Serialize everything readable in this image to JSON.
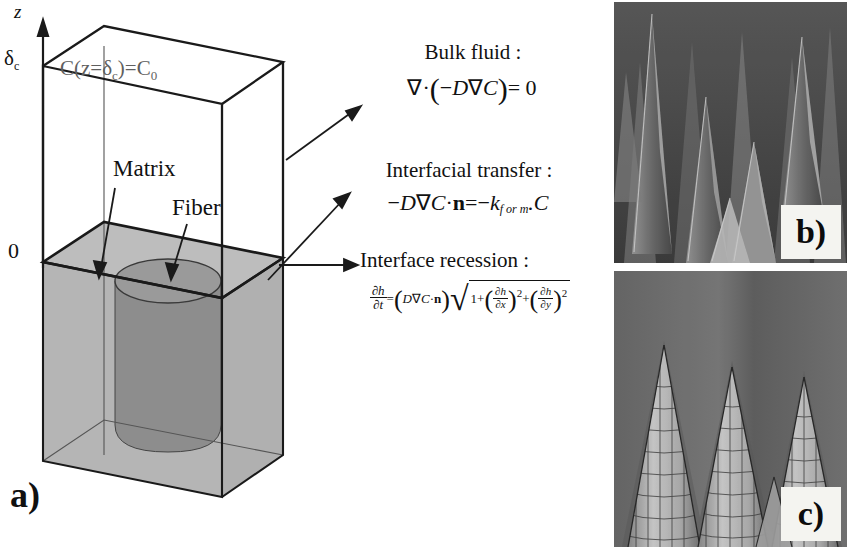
{
  "figure": {
    "panels": [
      {
        "id": "a",
        "tag": "a)",
        "caption_tag": "a)"
      },
      {
        "id": "b",
        "tag": "b)",
        "caption_tag": "b)"
      },
      {
        "id": "c",
        "tag": "c)",
        "caption_tag": "c)"
      }
    ]
  },
  "schematic": {
    "axis_label": "z",
    "axis_top_tick": "δ",
    "axis_top_tick_sub": "c",
    "axis_zero_tick": "0",
    "top_boundary_condition": "C(z=δ",
    "top_boundary_condition_sub": "c",
    "top_boundary_condition_end": ")=C",
    "top_boundary_condition_sub2": "0",
    "region_label_matrix": "Matrix",
    "region_label_fiber": "Fiber",
    "panel_tag": "a)",
    "colors": {
      "composite_block": "#b5b5b5",
      "fiber_cylinder": "#8d8d8d",
      "outline": "#1a1a1a",
      "top_text": "#5f5f5f"
    }
  },
  "equations": {
    "bulk": {
      "heading": "Bulk fluid :",
      "nabla": "∇",
      "dot": "·",
      "open": "(",
      "minus": "−",
      "D": "D",
      "C": "C",
      "close": ")",
      "equals": "= 0",
      "plain": "∇·(−D∇C) = 0"
    },
    "interfacial": {
      "heading": "Interfacial transfer :",
      "minus": "−",
      "D": "D",
      "nabla": "∇",
      "C": "C",
      "dot": "·",
      "n": "n",
      "equals": "=",
      "minus2": "−",
      "k": "k",
      "k_sub": "f or m",
      "dotC": ".C",
      "plain": "−D∇C·n = −k_(f or m).C"
    },
    "recession": {
      "heading": "Interface recession :",
      "lhs_num": "∂h",
      "lhs_den": "∂t",
      "equals": "=",
      "open": "(",
      "D": "D",
      "nabla": "∇",
      "C": "C",
      "dot": "·",
      "n": "n",
      "close": ")",
      "radical": "√",
      "one_plus": "1+",
      "t1_num": "∂h",
      "t1_den": "∂x",
      "t1_exp": "2",
      "plus": "+",
      "t2_num": "∂h",
      "t2_den": "∂y",
      "t2_exp": "2",
      "plain": "∂h/∂t = (D∇C·n)√(1+(∂h/∂x)²+(∂h/∂y)²)"
    }
  },
  "micrographs": {
    "b": {
      "tag": "b)",
      "type": "sem-micrograph",
      "subject": "sharpened fiber tips"
    },
    "c": {
      "tag": "c)",
      "type": "simulation-mesh",
      "subject": "simulated conical fiber tips"
    }
  }
}
